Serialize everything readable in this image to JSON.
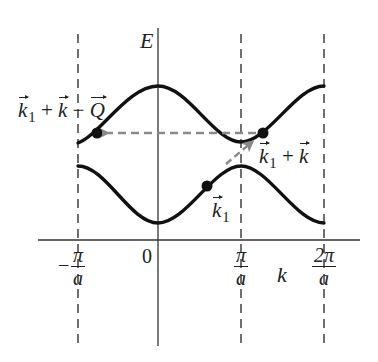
{
  "diagram": {
    "type": "band-structure",
    "axes": {
      "y_label": "E",
      "x_label": "k",
      "origin_label": "0",
      "tick_labels": [
        {
          "sign": "−",
          "numerator": "π",
          "denominator": "a"
        },
        {
          "sign": "",
          "numerator": "π",
          "denominator": "a"
        },
        {
          "sign": "",
          "numerator": "2π",
          "denominator": "a"
        }
      ]
    },
    "bands": [
      {
        "name": "upper-band",
        "shape": "cosine",
        "max_at": "0",
        "min_at": "±π/a"
      },
      {
        "name": "lower-band",
        "shape": "cosine",
        "min_at": "0",
        "max_at": "±π/a"
      }
    ],
    "points": {
      "k1": {
        "base": "k",
        "sub": "1"
      },
      "k1_plus_k": {
        "parts": [
          "k",
          "1",
          "+",
          "k"
        ]
      },
      "k1_plus_k_minus_Q": {
        "parts": [
          "k",
          "1",
          "+",
          "k",
          "−",
          "Q"
        ]
      }
    },
    "labels": {
      "k1_vec": "k",
      "k1_sub": "1",
      "plus": "+",
      "minus": "−",
      "k_vec": "k",
      "Q_vec": "Q"
    },
    "colors": {
      "curve": "#111111",
      "axis": "#333333",
      "dashed_boundary": "#333333",
      "arrow": "#8a8a8a"
    }
  }
}
